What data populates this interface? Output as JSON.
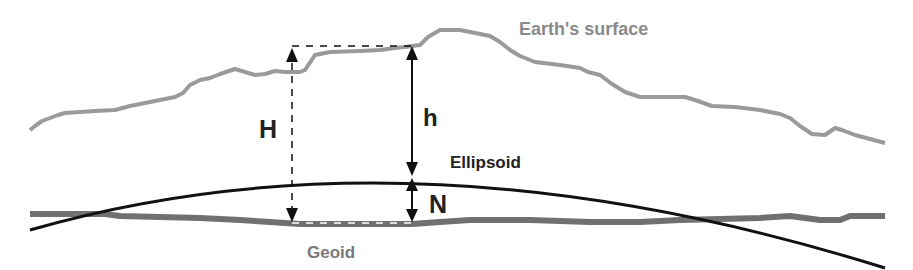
{
  "diagram": {
    "labels": {
      "earth_surface": "Earth's surface",
      "ellipsoid": "Ellipsoid",
      "geoid": "Geoid",
      "orthometric_height": "H",
      "ellipsoidal_height": "h",
      "geoid_undulation": "N"
    },
    "colors": {
      "earth_surface": "#9a9a9a",
      "ellipsoid": "#111111",
      "geoid": "#6e6e6e",
      "arrows": "#111111",
      "label_dark": "#222222",
      "label_gray": "#8a8a8a"
    }
  }
}
